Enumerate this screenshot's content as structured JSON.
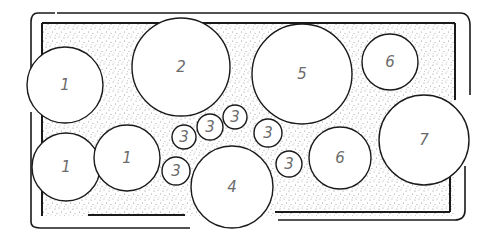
{
  "diagram": {
    "type": "planting-plan",
    "colors": {
      "ink": "#1a1a1a",
      "label": "#6b6b6b",
      "soil_dots": "#333333",
      "background": "#ffffff"
    },
    "bed": {
      "outer": {
        "x": 27,
        "y": 13,
        "w": 446,
        "h": 215,
        "rx": 10
      },
      "inner": {
        "x": 43,
        "y": 24,
        "w": 411,
        "h": 191
      }
    },
    "plants": [
      {
        "label": "1",
        "cx": 65,
        "cy": 85,
        "r": 38
      },
      {
        "label": "2",
        "cx": 181,
        "cy": 67,
        "r": 49
      },
      {
        "label": "5",
        "cx": 302,
        "cy": 74,
        "r": 50
      },
      {
        "label": "6",
        "cx": 390,
        "cy": 62,
        "r": 28
      },
      {
        "label": "7",
        "cx": 424,
        "cy": 140,
        "r": 45
      },
      {
        "label": "6",
        "cx": 340,
        "cy": 158,
        "r": 31
      },
      {
        "label": "4",
        "cx": 232,
        "cy": 187,
        "r": 41
      },
      {
        "label": "1",
        "cx": 66,
        "cy": 167,
        "r": 34
      },
      {
        "label": "1",
        "cx": 127,
        "cy": 158,
        "r": 33
      },
      {
        "label": "3",
        "cx": 184,
        "cy": 137,
        "r": 12
      },
      {
        "label": "3",
        "cx": 210,
        "cy": 127,
        "r": 13
      },
      {
        "label": "3",
        "cx": 235,
        "cy": 117,
        "r": 12
      },
      {
        "label": "3",
        "cx": 268,
        "cy": 133,
        "r": 14
      },
      {
        "label": "3",
        "cx": 289,
        "cy": 164,
        "r": 13
      },
      {
        "label": "3",
        "cx": 176,
        "cy": 171,
        "r": 14
      }
    ]
  }
}
